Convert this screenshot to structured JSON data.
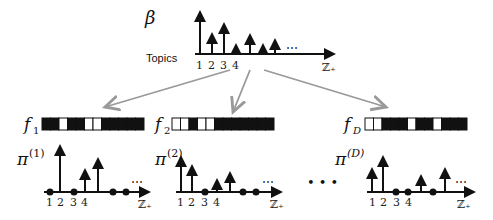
{
  "top": {
    "symbol": "β",
    "axis_label": "Topics",
    "ticks": [
      "1",
      "2",
      "3",
      "4"
    ],
    "axis_end": "ℤ₊",
    "ellipsis": "⋯",
    "stems": [
      {
        "x": 200,
        "top": 12
      },
      {
        "x": 212,
        "top": 34
      },
      {
        "x": 224,
        "top": 24
      },
      {
        "x": 236,
        "top": 45
      },
      {
        "x": 250,
        "top": 35
      },
      {
        "x": 263,
        "top": 45
      },
      {
        "x": 275,
        "top": 40
      }
    ]
  },
  "arrows_color": "#999999",
  "features": [
    {
      "label": "f",
      "sub": "1",
      "x": 42,
      "cells": [
        "b",
        "b",
        "w",
        "b",
        "b",
        "w",
        "w",
        "b",
        "b",
        "b",
        "b",
        "b"
      ]
    },
    {
      "label": "f",
      "sub": "2",
      "x": 172,
      "cells": [
        "w",
        "w",
        "b",
        "w",
        "w",
        "b",
        "b",
        "b",
        "b",
        "b",
        "b",
        "b"
      ]
    },
    {
      "label": "f",
      "sub": "D",
      "x": 365,
      "cells": [
        "w",
        "w",
        "b",
        "b",
        "b",
        "w",
        "b",
        "b",
        "w",
        "b",
        "b",
        "b"
      ]
    }
  ],
  "docs": [
    {
      "symbol": "π",
      "sup": "(1)",
      "ticks": [
        "1",
        "2",
        "3",
        "4"
      ],
      "axis_end": "ℤ₊",
      "ellipsis": "⋯"
    },
    {
      "symbol": "π",
      "sup": "(2)",
      "ticks": [
        "1",
        "2",
        "3",
        "4"
      ],
      "axis_end": "ℤ₊",
      "ellipsis": "⋯"
    },
    {
      "symbol": "π",
      "sup": "(D)",
      "ticks": [
        "1",
        "2",
        "3",
        "4"
      ],
      "axis_end": "ℤ₊",
      "ellipsis": "⋯"
    }
  ],
  "between_ellipsis": "• • •"
}
